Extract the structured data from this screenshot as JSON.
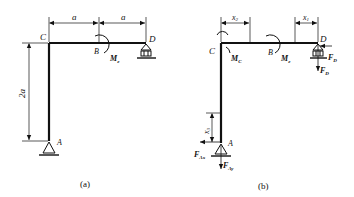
{
  "figure_a": {
    "caption": "(a)",
    "points": {
      "C": "C",
      "B": "B",
      "D": "D",
      "A": "A"
    },
    "moment_label": "M",
    "moment_sub": "e",
    "dims": {
      "left_span": "a",
      "right_span": "a",
      "height": "2a"
    }
  },
  "figure_b": {
    "caption": "(b)",
    "points": {
      "C": "C",
      "B": "B",
      "D": "D",
      "A": "A"
    },
    "moment_c_label": "M",
    "moment_c_sub": "C",
    "moment_b_label": "M",
    "moment_b_sub": "e",
    "dims": {
      "x2": "x",
      "x2_sub": "2",
      "x1": "x",
      "x1_sub": "1",
      "x3": "x",
      "x3_sub": "3"
    },
    "forces": {
      "FD_h": "F",
      "FD_h_sub": "D",
      "FD_v": "F",
      "FD_v_sub": "D",
      "FAx": "F",
      "FAx_sub": "Ax",
      "FAy": "F",
      "FAy_sub": "Ay"
    }
  }
}
